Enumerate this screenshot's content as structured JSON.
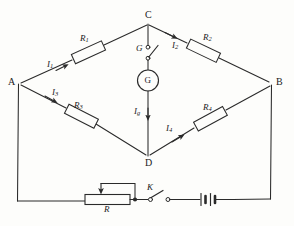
{
  "diagram": {
    "type": "circuit-schematic",
    "stroke_color": "#2a2a2a",
    "background_color": "#fdfdfb"
  },
  "nodes": [
    {
      "id": "A",
      "label": "A",
      "x": 18,
      "y": 84
    },
    {
      "id": "B",
      "label": "B",
      "x": 272,
      "y": 84
    },
    {
      "id": "C",
      "label": "C",
      "x": 148,
      "y": 22
    },
    {
      "id": "D",
      "label": "D",
      "x": 148,
      "y": 158
    }
  ],
  "components": {
    "r1": {
      "label": "R",
      "sub": "1",
      "branch": "A-C"
    },
    "r2": {
      "label": "R",
      "sub": "2",
      "branch": "C-B"
    },
    "r3": {
      "label": "R",
      "sub": "3",
      "branch": "A-D"
    },
    "r4": {
      "label": "R",
      "sub": "4",
      "branch": "D-B"
    },
    "rheostat": {
      "label": "R",
      "sub": "",
      "branch": "bottom"
    },
    "galvanometer": {
      "label": "G",
      "branch": "C-D"
    },
    "galv_key": {
      "label": "G",
      "state": "open"
    },
    "switch_k": {
      "label": "K",
      "state": "open"
    },
    "battery": {
      "label": "",
      "cells": 2
    }
  },
  "currents": [
    {
      "id": "I1",
      "label": "I",
      "sub": "1",
      "branch": "A-C"
    },
    {
      "id": "I2",
      "label": "I",
      "sub": "2",
      "branch": "C-B"
    },
    {
      "id": "I3",
      "label": "I",
      "sub": "3",
      "branch": "A-D"
    },
    {
      "id": "I4",
      "label": "I",
      "sub": "4",
      "branch": "D-B"
    },
    {
      "id": "Ig",
      "label": "I",
      "sub": "g",
      "branch": "C-D"
    }
  ]
}
